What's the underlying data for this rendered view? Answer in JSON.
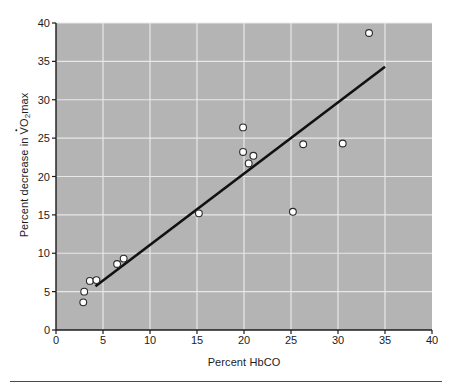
{
  "figure": {
    "background_color": "#ffffff",
    "plot_background_color": "#b4b4b4",
    "gridline_color": "#e8e8e8",
    "axis_color": "#1c1c1c",
    "line_color": "#111111",
    "marker_fill": "#ffffff",
    "marker_edge": "#2a2a2a"
  },
  "xlabel": "Percent HbCO",
  "ylabel_prefix": "Percent decrease in ",
  "ylabel_v": "V",
  "ylabel_o": "O",
  "ylabel_sub": "2",
  "ylabel_suffix": "max",
  "chart_data": {
    "type": "scatter",
    "title": "",
    "xlabel": "Percent HbCO",
    "ylabel": "Percent decrease in VO2max",
    "xlim": [
      0,
      40
    ],
    "ylim": [
      0,
      40
    ],
    "xticks": [
      0,
      5,
      10,
      15,
      20,
      25,
      30,
      35,
      40
    ],
    "yticks": [
      0,
      5,
      10,
      15,
      20,
      25,
      30,
      35,
      40
    ],
    "grid": true,
    "legend": "none",
    "series": [
      {
        "name": "Observations",
        "marker": "open-circle",
        "points": [
          {
            "x": 2.9,
            "y": 3.6
          },
          {
            "x": 3.0,
            "y": 5.0
          },
          {
            "x": 3.6,
            "y": 6.4
          },
          {
            "x": 4.3,
            "y": 6.5
          },
          {
            "x": 6.5,
            "y": 8.6
          },
          {
            "x": 7.2,
            "y": 9.3
          },
          {
            "x": 15.2,
            "y": 15.2
          },
          {
            "x": 19.9,
            "y": 26.4
          },
          {
            "x": 19.9,
            "y": 23.2
          },
          {
            "x": 20.5,
            "y": 21.7
          },
          {
            "x": 21.0,
            "y": 22.7
          },
          {
            "x": 25.2,
            "y": 15.4
          },
          {
            "x": 26.3,
            "y": 24.2
          },
          {
            "x": 30.5,
            "y": 24.3
          },
          {
            "x": 33.3,
            "y": 38.7
          }
        ]
      }
    ],
    "fit_line": {
      "name": "Regression line",
      "x_start": 4.2,
      "y_start": 5.7,
      "x_end": 35.0,
      "y_end": 34.3
    }
  },
  "ticks": {
    "x": [
      "0",
      "5",
      "10",
      "15",
      "20",
      "25",
      "30",
      "35",
      "40"
    ],
    "y": [
      "0",
      "5",
      "10",
      "15",
      "20",
      "25",
      "30",
      "35",
      "40"
    ]
  }
}
